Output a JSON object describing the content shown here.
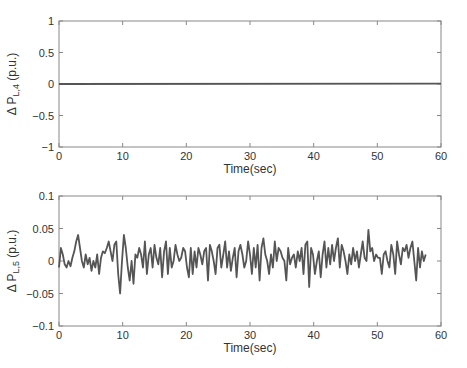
{
  "chart_data": [
    {
      "type": "line",
      "title": "",
      "xlabel": "Time(sec)",
      "ylabel": "Δ P_L,4 (p.u.)",
      "ylabel_main": "Δ P",
      "ylabel_sub": "L,4",
      "ylabel_unit": "(p.u.)",
      "xlim": [
        0,
        60
      ],
      "ylim": [
        -1,
        1
      ],
      "xticks": [
        "0",
        "10",
        "20",
        "30",
        "40",
        "50",
        "60"
      ],
      "yticks": [
        "1",
        "0.5",
        "0",
        "−0.5",
        "−1"
      ],
      "grid": false,
      "series": [
        {
          "name": "ΔP_L4",
          "x": [
            0,
            60
          ],
          "values": [
            0,
            0.005
          ],
          "color": "#555555"
        }
      ]
    },
    {
      "type": "line",
      "title": "",
      "xlabel": "Time(sec)",
      "ylabel": "Δ P_L,5 (p.u.)",
      "ylabel_main": "Δ P",
      "ylabel_sub": "L,5",
      "ylabel_unit": "(p.u.)",
      "xlim": [
        0,
        60
      ],
      "ylim": [
        -0.1,
        0.1
      ],
      "xticks": [
        "0",
        "10",
        "20",
        "30",
        "40",
        "50",
        "60"
      ],
      "yticks": [
        "0.1",
        "0.05",
        "0",
        "−0.05",
        "−0.1"
      ],
      "grid": false,
      "series": [
        {
          "name": "ΔP_L5",
          "color": "#555555",
          "x": [
            0,
            0.3,
            0.6,
            0.9,
            1.2,
            1.5,
            1.8,
            2.1,
            2.4,
            2.7,
            3.0,
            3.3,
            3.6,
            3.9,
            4.2,
            4.5,
            4.8,
            5.1,
            5.4,
            5.7,
            6.0,
            6.3,
            6.6,
            6.9,
            7.2,
            7.5,
            7.8,
            8.1,
            8.4,
            8.7,
            9.0,
            9.3,
            9.6,
            9.9,
            10.2,
            10.5,
            10.8,
            11.1,
            11.4,
            11.7,
            12.0,
            12.3,
            12.6,
            12.9,
            13.2,
            13.5,
            13.8,
            14.1,
            14.4,
            14.7,
            15.0,
            15.3,
            15.6,
            15.9,
            16.2,
            16.5,
            16.8,
            17.1,
            17.4,
            17.7,
            18.0,
            18.3,
            18.6,
            18.9,
            19.2,
            19.5,
            19.8,
            20.1,
            20.4,
            20.7,
            21.0,
            21.3,
            21.6,
            21.9,
            22.2,
            22.5,
            22.8,
            23.1,
            23.4,
            23.7,
            24.0,
            24.3,
            24.6,
            24.9,
            25.2,
            25.5,
            25.8,
            26.1,
            26.4,
            26.7,
            27.0,
            27.3,
            27.6,
            27.9,
            28.2,
            28.5,
            28.8,
            29.1,
            29.4,
            29.7,
            30.0,
            30.3,
            30.6,
            30.9,
            31.2,
            31.5,
            31.8,
            32.1,
            32.4,
            32.7,
            33.0,
            33.3,
            33.6,
            33.9,
            34.2,
            34.5,
            34.8,
            35.1,
            35.4,
            35.7,
            36.0,
            36.3,
            36.6,
            36.9,
            37.2,
            37.5,
            37.8,
            38.1,
            38.4,
            38.7,
            39.0,
            39.3,
            39.6,
            39.9,
            40.2,
            40.5,
            40.8,
            41.1,
            41.4,
            41.7,
            42.0,
            42.3,
            42.6,
            42.9,
            43.2,
            43.5,
            43.8,
            44.1,
            44.4,
            44.7,
            45.0,
            45.3,
            45.6,
            45.9,
            46.2,
            46.5,
            46.8,
            47.1,
            47.4,
            47.7,
            48.0,
            48.3,
            48.6,
            48.9,
            49.2,
            49.5,
            49.8,
            50.1,
            50.4,
            50.7,
            51.0,
            51.3,
            51.6,
            51.9,
            52.2,
            52.5,
            52.8,
            53.1,
            53.4,
            53.7,
            54.0,
            54.3,
            54.6,
            54.9,
            55.2,
            55.5,
            55.8,
            56.1,
            56.4,
            56.7,
            57.0,
            57.3,
            57.6,
            57.9,
            58.2,
            58.5,
            58.8,
            59.1,
            59.4,
            59.7,
            60.0
          ],
          "values": [
            -0.01,
            0.02,
            0.01,
            -0.005,
            -0.01,
            0.0,
            -0.008,
            0.005,
            0.015,
            0.03,
            0.04,
            0.02,
            0.0,
            -0.01,
            0.01,
            -0.005,
            0.005,
            -0.015,
            0.0,
            -0.01,
            0.01,
            -0.02,
            0.005,
            0.015,
            0.012,
            0.02,
            0.03,
            0.015,
            0.0,
            0.025,
            0.03,
            -0.02,
            -0.05,
            0.0,
            0.04,
            0.02,
            -0.01,
            -0.03,
            0.0,
            -0.035,
            0.01,
            0.005,
            0.02,
            0.01,
            -0.01,
            0.03,
            -0.02,
            0.01,
            0.02,
            -0.01,
            0.025,
            0.005,
            -0.005,
            0.02,
            -0.025,
            0.015,
            0.03,
            -0.02,
            0.02,
            -0.01,
            0.0,
            0.025,
            0.01,
            0.0,
            0.005,
            0.02,
            0.015,
            -0.01,
            -0.025,
            0.02,
            -0.02,
            0.015,
            -0.01,
            0.02,
            0.01,
            -0.005,
            0.015,
            0.02,
            -0.03,
            0.025,
            0.015,
            0.0,
            -0.02,
            0.02,
            0.025,
            -0.01,
            0.01,
            0.03,
            -0.01,
            0.015,
            -0.015,
            0.005,
            0.02,
            -0.025,
            0.015,
            0.025,
            0.01,
            -0.01,
            0.0,
            0.03,
            0.01,
            -0.02,
            0.02,
            -0.01,
            0.025,
            -0.03,
            0.02,
            0.035,
            0.01,
            0.0,
            -0.02,
            0.01,
            -0.01,
            0.03,
            0.0,
            0.02,
            0.015,
            0.005,
            0.0,
            -0.03,
            0.02,
            -0.005,
            0.005,
            0.01,
            -0.01,
            0.015,
            0.0,
            0.02,
            -0.02,
            0.025,
            0.03,
            -0.04,
            0.02,
            0.01,
            -0.02,
            0.0,
            0.015,
            -0.025,
            0.01,
            0.03,
            -0.01,
            0.02,
            -0.005,
            0.025,
            0.0,
            0.02,
            0.035,
            -0.01,
            0.025,
            0.015,
            0.0,
            -0.02,
            0.01,
            -0.005,
            0.02,
            0.0,
            0.015,
            -0.01,
            0.01,
            0.03,
            0.005,
            0.0,
            0.048,
            0.015,
            0.02,
            0.0,
            0.01,
            0.005,
            0.005,
            -0.02,
            0.01,
            0.015,
            0.0,
            -0.01,
            0.025,
            0.01,
            -0.02,
            0.03,
            0.01,
            -0.005,
            0.02,
            0.015,
            0.025,
            0.005,
            0.02,
            0.03,
            0.0,
            -0.03,
            0.02,
            -0.01,
            0.015,
            0.0,
            0.01
          ]
        }
      ]
    }
  ]
}
